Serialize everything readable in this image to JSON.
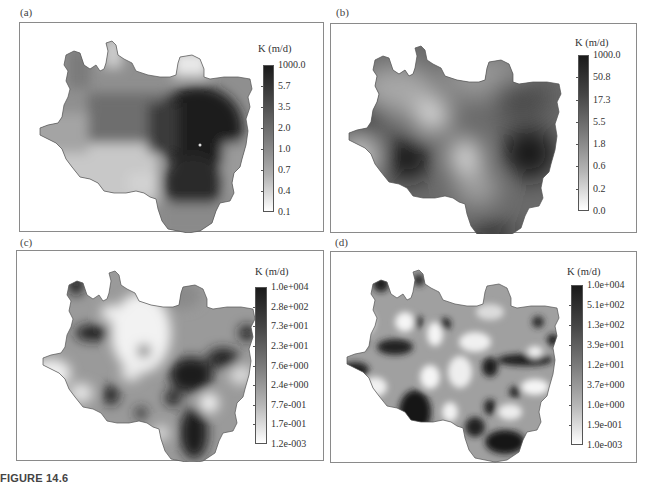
{
  "figure": {
    "caption": "FIGURE 14.6",
    "panels": [
      {
        "id": "a",
        "label": "(a)",
        "colorbar": {
          "title": "K (m/d)",
          "ticks": [
            "1000.0",
            "5.7",
            "3.5",
            "2.0",
            "1.0",
            "0.7",
            "0.4",
            "0.1"
          ],
          "color_top": "#1a1a1a",
          "color_bottom": "#ffffff"
        }
      },
      {
        "id": "b",
        "label": "(b)",
        "colorbar": {
          "title": "K (m/d)",
          "ticks": [
            "1000.0",
            "50.8",
            "17.3",
            "5.5",
            "1.8",
            "0.6",
            "0.2",
            "0.0"
          ],
          "color_top": "#1a1a1a",
          "color_bottom": "#ffffff"
        }
      },
      {
        "id": "c",
        "label": "(c)",
        "colorbar": {
          "title": "K (m/d)",
          "ticks": [
            "1.0e+004",
            "2.8e+002",
            "7.3e+001",
            "2.3e+001",
            "7.6e+000",
            "2.4e+000",
            "7.7e-001",
            "1.7e-001",
            "1.2e-003"
          ],
          "color_top": "#1a1a1a",
          "color_bottom": "#ffffff"
        }
      },
      {
        "id": "d",
        "label": "(d)",
        "colorbar": {
          "title": "K (m/d)",
          "ticks": [
            "1.0e+004",
            "5.1e+002",
            "1.3e+002",
            "3.9e+001",
            "1.2e+001",
            "3.7e+000",
            "1.0e+000",
            "1.9e-001",
            "1.0e-003"
          ],
          "color_top": "#1a1a1a",
          "color_bottom": "#ffffff"
        }
      }
    ]
  }
}
